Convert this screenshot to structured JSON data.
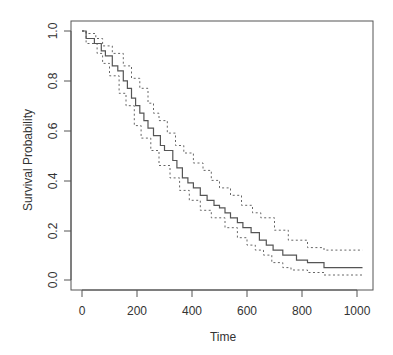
{
  "chart_data": {
    "type": "line",
    "title": "",
    "xlabel": "Time",
    "ylabel": "Survival Probability",
    "xlim": [
      0,
      1020
    ],
    "ylim": [
      0,
      1
    ],
    "grid": false,
    "legend": null,
    "x_ticks": [
      "0",
      "200",
      "400",
      "600",
      "800",
      "1000"
    ],
    "y_ticks": [
      "0.0",
      "0.2",
      "0.4",
      "0.6",
      "0.8",
      "1.0"
    ],
    "step": true,
    "x_end": 1020,
    "series": [
      {
        "name": "Survival estimate",
        "style": "solid",
        "points": [
          [
            0,
            1.0
          ],
          [
            15,
            0.97
          ],
          [
            45,
            0.95
          ],
          [
            70,
            0.92
          ],
          [
            85,
            0.9
          ],
          [
            110,
            0.86
          ],
          [
            130,
            0.84
          ],
          [
            150,
            0.8
          ],
          [
            165,
            0.77
          ],
          [
            180,
            0.73
          ],
          [
            195,
            0.7
          ],
          [
            210,
            0.67
          ],
          [
            225,
            0.64
          ],
          [
            240,
            0.61
          ],
          [
            260,
            0.58
          ],
          [
            285,
            0.54
          ],
          [
            300,
            0.52
          ],
          [
            330,
            0.48
          ],
          [
            345,
            0.45
          ],
          [
            365,
            0.41
          ],
          [
            385,
            0.39
          ],
          [
            405,
            0.37
          ],
          [
            430,
            0.34
          ],
          [
            455,
            0.32
          ],
          [
            480,
            0.3
          ],
          [
            500,
            0.29
          ],
          [
            520,
            0.27
          ],
          [
            540,
            0.25
          ],
          [
            565,
            0.23
          ],
          [
            585,
            0.21
          ],
          [
            615,
            0.19
          ],
          [
            645,
            0.16
          ],
          [
            670,
            0.14
          ],
          [
            695,
            0.12
          ],
          [
            730,
            0.1
          ],
          [
            780,
            0.08
          ],
          [
            820,
            0.07
          ],
          [
            880,
            0.05
          ]
        ]
      },
      {
        "name": "Upper 95% CI",
        "style": "dashed",
        "points": [
          [
            0,
            1.0
          ],
          [
            15,
            0.99
          ],
          [
            50,
            0.97
          ],
          [
            75,
            0.94
          ],
          [
            110,
            0.91
          ],
          [
            150,
            0.86
          ],
          [
            180,
            0.81
          ],
          [
            210,
            0.77
          ],
          [
            240,
            0.71
          ],
          [
            260,
            0.67
          ],
          [
            280,
            0.64
          ],
          [
            310,
            0.59
          ],
          [
            340,
            0.54
          ],
          [
            370,
            0.51
          ],
          [
            405,
            0.47
          ],
          [
            440,
            0.44
          ],
          [
            470,
            0.4
          ],
          [
            500,
            0.37
          ],
          [
            540,
            0.34
          ],
          [
            580,
            0.3
          ],
          [
            620,
            0.27
          ],
          [
            650,
            0.25
          ],
          [
            700,
            0.2
          ],
          [
            750,
            0.16
          ],
          [
            820,
            0.13
          ],
          [
            880,
            0.12
          ]
        ]
      },
      {
        "name": "Lower 95% CI",
        "style": "dashed",
        "points": [
          [
            0,
            1.0
          ],
          [
            15,
            0.95
          ],
          [
            55,
            0.91
          ],
          [
            75,
            0.87
          ],
          [
            100,
            0.82
          ],
          [
            135,
            0.75
          ],
          [
            160,
            0.7
          ],
          [
            190,
            0.62
          ],
          [
            215,
            0.57
          ],
          [
            250,
            0.52
          ],
          [
            280,
            0.46
          ],
          [
            320,
            0.41
          ],
          [
            355,
            0.36
          ],
          [
            390,
            0.32
          ],
          [
            430,
            0.28
          ],
          [
            470,
            0.25
          ],
          [
            520,
            0.21
          ],
          [
            565,
            0.17
          ],
          [
            600,
            0.14
          ],
          [
            630,
            0.12
          ],
          [
            660,
            0.1
          ],
          [
            690,
            0.07
          ],
          [
            730,
            0.05
          ],
          [
            760,
            0.04
          ],
          [
            820,
            0.03
          ],
          [
            880,
            0.02
          ]
        ]
      }
    ]
  }
}
